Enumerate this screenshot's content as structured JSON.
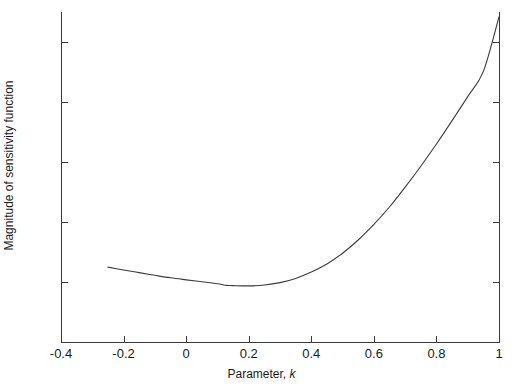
{
  "chart_data": {
    "type": "line",
    "title": "",
    "xlabel": "Parameter, k",
    "xlabel_prefix": "Parameter, ",
    "xlabel_var": "k",
    "ylabel": "Magnitude of sensitivity function",
    "xlim": [
      -0.4,
      1.0
    ],
    "ylim": [
      0.5,
      3.25
    ],
    "xticks": [
      -0.4,
      -0.2,
      0,
      0.2,
      0.4,
      0.6,
      0.8,
      1
    ],
    "xtick_labels": [
      "-0.4",
      "-0.2",
      "0",
      "0.2",
      "0.4",
      "0.6",
      "0.8",
      "1"
    ],
    "yticks": [
      0.5,
      1,
      1.5,
      2,
      2.5,
      3
    ],
    "ytick_labels": [
      "0.5",
      "1",
      "1.5",
      "2",
      "2.5",
      "3"
    ],
    "grid": false,
    "legend": null,
    "line_color": "#3a3a3a",
    "line_width": 1.1,
    "series": [
      {
        "name": "sensitivity magnitude",
        "x": [
          -0.25,
          -0.2,
          -0.15,
          -0.1,
          -0.05,
          0.0,
          0.05,
          0.1,
          0.13,
          0.15,
          0.2,
          0.25,
          0.3,
          0.35,
          0.4,
          0.45,
          0.5,
          0.55,
          0.6,
          0.65,
          0.7,
          0.75,
          0.8,
          0.85,
          0.9,
          0.95,
          1.0
        ],
        "y": [
          1.124,
          1.1,
          1.078,
          1.056,
          1.035,
          1.018,
          1.002,
          0.985,
          0.972,
          0.97,
          0.968,
          0.975,
          0.995,
          1.03,
          1.083,
          1.15,
          1.24,
          1.35,
          1.48,
          1.625,
          1.79,
          1.965,
          2.15,
          2.345,
          2.545,
          2.755,
          3.21
        ]
      }
    ]
  }
}
